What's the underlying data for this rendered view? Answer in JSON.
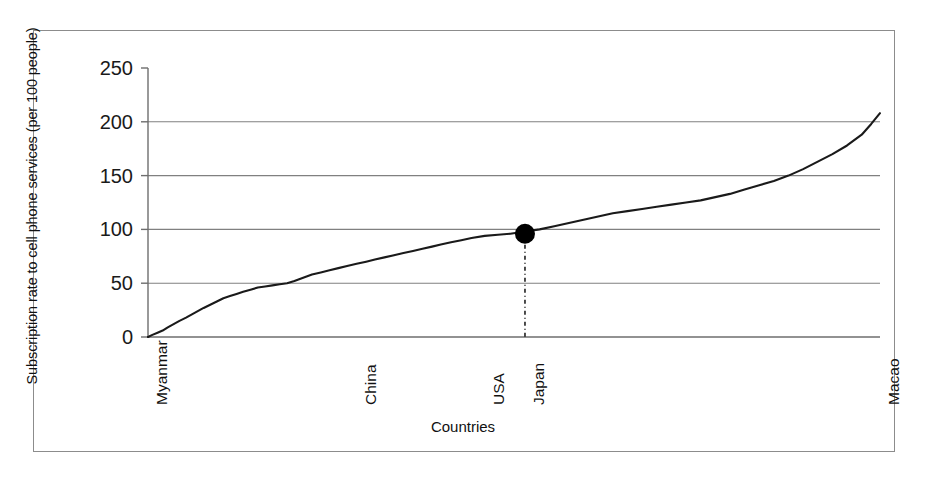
{
  "chart_data": {
    "type": "line",
    "title": "",
    "xlabel": "Countries",
    "ylabel": "Subscription rate to cell phone services (per 100 people)",
    "ylim": [
      0,
      250
    ],
    "yticks": [
      0,
      50,
      100,
      150,
      200,
      250
    ],
    "ytick_labels": [
      "0",
      "50",
      "100",
      "150",
      "200",
      "250"
    ],
    "grid": "horizontal",
    "legend": "none",
    "xtick_labels": [
      "Myanmar",
      "China",
      "USA",
      "Japan",
      "Macao"
    ],
    "xtick_positions_fraction": [
      0.0,
      0.285,
      0.46,
      0.515,
      1.0
    ],
    "x_description": "Countries sorted ascending by subscription rate, from Myanmar (lowest) to Macao (highest)",
    "series": [
      {
        "name": "Subscription rate",
        "points_fraction_x": [
          0.0,
          0.006,
          0.013,
          0.02,
          0.027,
          0.035,
          0.043,
          0.052,
          0.06,
          0.068,
          0.076,
          0.085,
          0.094,
          0.103,
          0.112,
          0.121,
          0.13,
          0.14,
          0.15,
          0.16,
          0.17,
          0.18,
          0.19,
          0.2,
          0.212,
          0.224,
          0.236,
          0.248,
          0.26,
          0.272,
          0.285,
          0.298,
          0.31,
          0.323,
          0.336,
          0.349,
          0.362,
          0.375,
          0.388,
          0.4,
          0.414,
          0.428,
          0.442,
          0.46,
          0.478,
          0.495,
          0.515,
          0.535,
          0.555,
          0.575,
          0.595,
          0.615,
          0.635,
          0.655,
          0.675,
          0.695,
          0.715,
          0.735,
          0.755,
          0.775,
          0.795,
          0.815,
          0.835,
          0.855,
          0.875,
          0.895,
          0.915,
          0.935,
          0.955,
          0.975,
          0.988,
          1.0
        ],
        "values": [
          0,
          2,
          4,
          6,
          9,
          12,
          15,
          18,
          21,
          24,
          27,
          30,
          33,
          36,
          38,
          40,
          42,
          44,
          46,
          47,
          48,
          49,
          50,
          52,
          55,
          58,
          60,
          62,
          64,
          66,
          68,
          70,
          72,
          74,
          76,
          78,
          80,
          82,
          84,
          86,
          88,
          90,
          92,
          94,
          95,
          96,
          98,
          100,
          103,
          106,
          109,
          112,
          115,
          117,
          119,
          121,
          123,
          125,
          127,
          130,
          133,
          137,
          141,
          145,
          150,
          156,
          163,
          170,
          178,
          188,
          198,
          208
        ]
      }
    ],
    "annotations": [
      {
        "name": "japan-marker",
        "type": "point-marker",
        "label": "Japan",
        "x_fraction": 0.515,
        "value": 96,
        "marker": "filled-circle",
        "dropline": "dash-dot vertical line to x-axis"
      }
    ],
    "colors": {
      "line": "#1a1a1a",
      "grid": "#808080",
      "axis": "#6e6e6e",
      "frame": "#8c8c8c",
      "marker": "#000000",
      "background": "#ffffff"
    }
  }
}
